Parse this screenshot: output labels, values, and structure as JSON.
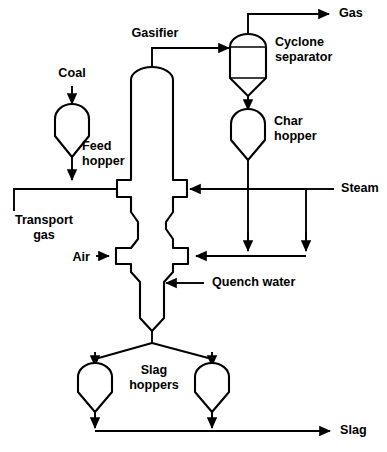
{
  "diagram": {
    "stroke_color": "#000000",
    "background_color": "#ffffff",
    "labels": {
      "coal": "Coal",
      "gasifier": "Gasifier",
      "gas": "Gas",
      "cyclone_separator_line1": "Cyclone",
      "cyclone_separator_line2": "separator",
      "char_hopper_line1": "Char",
      "char_hopper_line2": "hopper",
      "feed_hopper_line1": "Feed",
      "feed_hopper_line2": "hopper",
      "steam": "Steam",
      "transport_gas_line1": "Transport",
      "transport_gas_line2": "gas",
      "air": "Air",
      "quench_water": "Quench water",
      "slag_hoppers_line1": "Slag",
      "slag_hoppers_line2": "hoppers",
      "slag": "Slag"
    },
    "equipment": [
      {
        "id": "feed-hopper",
        "name": "Feed hopper",
        "type": "hopper"
      },
      {
        "id": "gasifier",
        "name": "Gasifier",
        "type": "vertical-vessel"
      },
      {
        "id": "cyclone-separator",
        "name": "Cyclone separator",
        "type": "cyclone"
      },
      {
        "id": "char-hopper",
        "name": "Char hopper",
        "type": "hopper"
      },
      {
        "id": "slag-hopper-left",
        "name": "Slag hoppers",
        "type": "hopper"
      },
      {
        "id": "slag-hopper-right",
        "name": "Slag hoppers",
        "type": "hopper"
      }
    ],
    "streams": [
      {
        "id": "coal-feed",
        "name": "Coal",
        "direction": "down"
      },
      {
        "id": "transport-gas",
        "name": "Transport gas",
        "direction": "right"
      },
      {
        "id": "steam",
        "name": "Steam",
        "direction": "left"
      },
      {
        "id": "air",
        "name": "Air",
        "direction": "right"
      },
      {
        "id": "quench-water",
        "name": "Quench water",
        "direction": "left"
      },
      {
        "id": "gas-product",
        "name": "Gas",
        "direction": "right"
      },
      {
        "id": "slag-product",
        "name": "Slag",
        "direction": "right"
      }
    ]
  }
}
